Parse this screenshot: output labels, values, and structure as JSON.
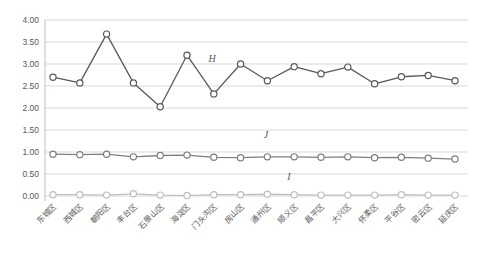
{
  "chart_data": {
    "type": "line",
    "title": "",
    "xlabel": "",
    "ylabel": "",
    "ylim": [
      0,
      4
    ],
    "grid": true,
    "legend": "none",
    "marker": "open-circle",
    "text_color": "#595959",
    "grid_color": "#d9d9d9",
    "axis_color": "#bfbfbf",
    "y_ticks": [
      "4.00",
      "3.50",
      "3.00",
      "2.50",
      "2.00",
      "1.50",
      "1.00",
      "0.50",
      "0.00"
    ],
    "y_tick_values": [
      4.0,
      3.5,
      3.0,
      2.5,
      2.0,
      1.5,
      1.0,
      0.5,
      0.0
    ],
    "categories": [
      "东城区",
      "西城区",
      "朝阳区",
      "丰台区",
      "石景山区",
      "海淀区",
      "门头沟区",
      "房山区",
      "通州区",
      "顺义区",
      "昌平区",
      "大兴区",
      "怀柔区",
      "平谷区",
      "密云区",
      "延庆区"
    ],
    "series": [
      {
        "name": "H",
        "color": "#595959",
        "values": [
          2.7,
          2.57,
          3.68,
          2.57,
          2.03,
          3.2,
          2.32,
          3.0,
          2.62,
          2.94,
          2.78,
          2.93,
          2.55,
          2.71,
          2.74,
          2.62
        ],
        "label_pos": {
          "x": 212,
          "y": 62
        }
      },
      {
        "name": "J",
        "color": "#7f7f7f",
        "values": [
          0.95,
          0.94,
          0.95,
          0.89,
          0.92,
          0.93,
          0.88,
          0.87,
          0.89,
          0.89,
          0.88,
          0.89,
          0.87,
          0.88,
          0.86,
          0.84
        ],
        "label_pos": {
          "x": 266,
          "y": 138
        }
      },
      {
        "name": "I",
        "color": "#bfbfbf",
        "values": [
          0.03,
          0.03,
          0.02,
          0.05,
          0.02,
          0.01,
          0.03,
          0.03,
          0.04,
          0.03,
          0.02,
          0.02,
          0.02,
          0.03,
          0.02,
          0.02
        ],
        "label_pos": {
          "x": 289,
          "y": 180
        }
      }
    ]
  }
}
